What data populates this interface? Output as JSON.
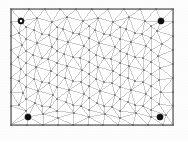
{
  "figure": {
    "title": "",
    "background_color": "#fdfdfd",
    "frame": {
      "name": "mesh-domain-boundary",
      "x": 11,
      "y": 9,
      "width": 162,
      "height": 116,
      "stroke_color": "#5a5a5a",
      "stroke_width": 1.2,
      "fill_color": "#ffffff"
    }
  },
  "chart_data": {
    "type": "scatter",
    "title": "",
    "subtitle": "",
    "xlabel": "",
    "ylabel": "",
    "xlim": [
      11,
      173
    ],
    "ylim": [
      9,
      125
    ],
    "grid": false,
    "legend": null,
    "mesh": {
      "edge_color": "#8f8f8f",
      "edge_width": 0.45,
      "vertex_color": "#4d4d4d",
      "vertex_radius": 0.85,
      "approx_vertex_count": 190,
      "approx_edge_count": 540,
      "approx_triangle_count": 350
    },
    "markers": [
      {
        "name": "corner-marker-top-left",
        "style": "ring",
        "x": 21,
        "y": 21,
        "outer_radius": 3.1,
        "inner_radius": 1.25,
        "color": "#111111",
        "fill": "#ffffff"
      },
      {
        "name": "corner-marker-top-right",
        "style": "filled-circle",
        "x": 161,
        "y": 21,
        "outer_radius": 3.1,
        "inner_radius": 0,
        "color": "#111111",
        "fill": "#111111"
      },
      {
        "name": "corner-marker-bottom-left",
        "style": "filled-circle",
        "x": 28,
        "y": 117,
        "outer_radius": 3.1,
        "inner_radius": 0,
        "color": "#111111",
        "fill": "#111111"
      },
      {
        "name": "corner-marker-bottom-right",
        "style": "filled-circle",
        "x": 160,
        "y": 117,
        "outer_radius": 3.1,
        "inner_radius": 0,
        "color": "#111111",
        "fill": "#111111"
      }
    ],
    "vertices": [
      [
        11,
        9
      ],
      [
        29,
        9
      ],
      [
        45,
        9
      ],
      [
        60,
        9
      ],
      [
        76,
        9
      ],
      [
        92,
        9
      ],
      [
        108,
        9
      ],
      [
        124,
        9
      ],
      [
        140,
        9
      ],
      [
        156,
        9
      ],
      [
        173,
        9
      ],
      [
        11,
        22
      ],
      [
        11,
        36
      ],
      [
        11,
        50
      ],
      [
        11,
        64
      ],
      [
        11,
        78
      ],
      [
        11,
        92
      ],
      [
        11,
        106
      ],
      [
        11,
        125
      ],
      [
        173,
        22
      ],
      [
        173,
        36
      ],
      [
        173,
        50
      ],
      [
        173,
        64
      ],
      [
        173,
        78
      ],
      [
        173,
        92
      ],
      [
        173,
        106
      ],
      [
        173,
        125
      ],
      [
        27,
        125
      ],
      [
        43,
        125
      ],
      [
        58,
        125
      ],
      [
        73,
        125
      ],
      [
        88,
        125
      ],
      [
        103,
        125
      ],
      [
        118,
        125
      ],
      [
        133,
        125
      ],
      [
        148,
        125
      ],
      [
        163,
        125
      ],
      [
        21,
        21
      ],
      [
        37,
        18
      ],
      [
        52,
        22
      ],
      [
        67,
        17
      ],
      [
        83,
        21
      ],
      [
        98,
        18
      ],
      [
        113,
        22
      ],
      [
        129,
        17
      ],
      [
        145,
        21
      ],
      [
        161,
        21
      ],
      [
        19,
        33
      ],
      [
        34,
        30
      ],
      [
        49,
        35
      ],
      [
        63,
        29
      ],
      [
        79,
        34
      ],
      [
        95,
        30
      ],
      [
        110,
        35
      ],
      [
        126,
        29
      ],
      [
        142,
        34
      ],
      [
        157,
        31
      ],
      [
        22,
        45
      ],
      [
        37,
        43
      ],
      [
        52,
        47
      ],
      [
        68,
        42
      ],
      [
        84,
        46
      ],
      [
        99,
        43
      ],
      [
        115,
        47
      ],
      [
        131,
        42
      ],
      [
        146,
        46
      ],
      [
        162,
        44
      ],
      [
        18,
        57
      ],
      [
        33,
        55
      ],
      [
        48,
        59
      ],
      [
        64,
        54
      ],
      [
        80,
        58
      ],
      [
        96,
        55
      ],
      [
        111,
        59
      ],
      [
        127,
        54
      ],
      [
        143,
        58
      ],
      [
        158,
        56
      ],
      [
        21,
        69
      ],
      [
        36,
        67
      ],
      [
        51,
        71
      ],
      [
        67,
        66
      ],
      [
        82,
        70
      ],
      [
        98,
        67
      ],
      [
        113,
        71
      ],
      [
        129,
        66
      ],
      [
        144,
        70
      ],
      [
        160,
        68
      ],
      [
        19,
        81
      ],
      [
        34,
        79
      ],
      [
        49,
        83
      ],
      [
        65,
        78
      ],
      [
        81,
        82
      ],
      [
        96,
        79
      ],
      [
        112,
        83
      ],
      [
        128,
        78
      ],
      [
        143,
        82
      ],
      [
        159,
        80
      ],
      [
        23,
        93
      ],
      [
        38,
        91
      ],
      [
        53,
        95
      ],
      [
        69,
        90
      ],
      [
        84,
        94
      ],
      [
        100,
        91
      ],
      [
        115,
        95
      ],
      [
        131,
        90
      ],
      [
        146,
        94
      ],
      [
        161,
        92
      ],
      [
        19,
        105
      ],
      [
        35,
        103
      ],
      [
        50,
        107
      ],
      [
        66,
        102
      ],
      [
        81,
        106
      ],
      [
        97,
        103
      ],
      [
        112,
        107
      ],
      [
        128,
        102
      ],
      [
        143,
        106
      ],
      [
        159,
        104
      ],
      [
        28,
        117
      ],
      [
        43,
        114
      ],
      [
        58,
        118
      ],
      [
        74,
        113
      ],
      [
        89,
        117
      ],
      [
        105,
        114
      ],
      [
        120,
        118
      ],
      [
        136,
        113
      ],
      [
        151,
        117
      ],
      [
        166,
        115
      ],
      [
        26,
        27
      ],
      [
        57,
        27
      ],
      [
        89,
        26
      ],
      [
        120,
        27
      ],
      [
        151,
        26
      ],
      [
        26,
        39
      ],
      [
        57,
        39
      ],
      [
        89,
        38
      ],
      [
        120,
        39
      ],
      [
        151,
        38
      ],
      [
        26,
        51
      ],
      [
        57,
        51
      ],
      [
        89,
        50
      ],
      [
        120,
        51
      ],
      [
        151,
        50
      ],
      [
        26,
        63
      ],
      [
        57,
        63
      ],
      [
        89,
        62
      ],
      [
        120,
        63
      ],
      [
        151,
        62
      ],
      [
        26,
        75
      ],
      [
        57,
        75
      ],
      [
        89,
        74
      ],
      [
        120,
        75
      ],
      [
        151,
        74
      ],
      [
        26,
        87
      ],
      [
        57,
        87
      ],
      [
        89,
        86
      ],
      [
        120,
        87
      ],
      [
        151,
        86
      ],
      [
        26,
        99
      ],
      [
        57,
        99
      ],
      [
        89,
        98
      ],
      [
        120,
        99
      ],
      [
        151,
        98
      ],
      [
        26,
        111
      ],
      [
        57,
        111
      ],
      [
        89,
        110
      ],
      [
        120,
        111
      ],
      [
        151,
        110
      ],
      [
        42,
        34
      ],
      [
        73,
        33
      ],
      [
        104,
        34
      ],
      [
        135,
        33
      ],
      [
        42,
        58
      ],
      [
        73,
        57
      ],
      [
        104,
        58
      ],
      [
        135,
        57
      ],
      [
        42,
        82
      ],
      [
        73,
        81
      ],
      [
        104,
        82
      ],
      [
        135,
        81
      ],
      [
        42,
        106
      ],
      [
        73,
        105
      ],
      [
        104,
        106
      ],
      [
        135,
        105
      ]
    ]
  }
}
